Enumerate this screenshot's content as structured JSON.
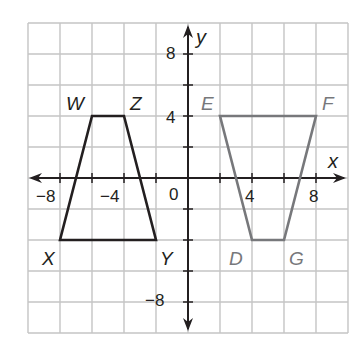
{
  "plane": {
    "x_range": [
      -10,
      10
    ],
    "y_range": [
      -10,
      10
    ],
    "grid_step": 2,
    "grid_color": "#c4c4c4",
    "axis_color": "#231f20",
    "x_axis_label": "x",
    "y_axis_label": "y",
    "x_tick_labels": [
      {
        "value": -8,
        "text": "−8"
      },
      {
        "value": -4,
        "text": "−4"
      },
      {
        "value": 4,
        "text": "4"
      },
      {
        "value": 8,
        "text": "8"
      }
    ],
    "y_tick_labels": [
      {
        "value": 8,
        "text": "8"
      },
      {
        "value": 4,
        "text": "4"
      },
      {
        "value": -8,
        "text": "−8"
      }
    ],
    "origin_label": "0"
  },
  "figures": [
    {
      "name": "WZYX",
      "color": "#231f20",
      "vertices": [
        {
          "label": "W",
          "x": -6,
          "y": 4
        },
        {
          "label": "Z",
          "x": -4,
          "y": 4
        },
        {
          "label": "Y",
          "x": -2,
          "y": -4
        },
        {
          "label": "X",
          "x": -8,
          "y": -4
        }
      ]
    },
    {
      "name": "EFGD",
      "color": "#77787b",
      "vertices": [
        {
          "label": "E",
          "x": 2,
          "y": 4
        },
        {
          "label": "F",
          "x": 8,
          "y": 4
        },
        {
          "label": "G",
          "x": 6,
          "y": -4
        },
        {
          "label": "D",
          "x": 4,
          "y": -4
        }
      ]
    }
  ],
  "labels": {
    "W": "W",
    "Z": "Z",
    "Y": "Y",
    "X": "X",
    "E": "E",
    "F": "F",
    "G": "G",
    "D": "D"
  }
}
